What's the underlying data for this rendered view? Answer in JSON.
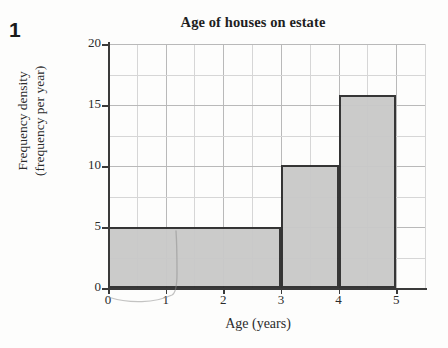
{
  "question_number": "1",
  "chart_data": {
    "type": "bar",
    "title": "Age of houses on estate",
    "xlabel": "Age (years)",
    "ylabel_line1": "Frequency density",
    "ylabel_line2": "(frequency per year)",
    "xlim": [
      0,
      5.5
    ],
    "ylim": [
      0,
      20
    ],
    "grid": true,
    "grid_x_step": 0.5,
    "grid_y_step": 2.5,
    "legend": "none",
    "x_ticks": [
      "0",
      "1",
      "2",
      "3",
      "4",
      "5"
    ],
    "x_tick_values": [
      0,
      1,
      2,
      3,
      4,
      5
    ],
    "y_ticks": [
      "0",
      "5",
      "10",
      "15",
      "20"
    ],
    "y_tick_values": [
      0,
      5,
      10,
      15,
      20
    ],
    "bars": [
      {
        "label": "0-3",
        "x_start": 0,
        "x_end": 3,
        "value": 5.0
      },
      {
        "label": "3-4",
        "x_start": 3,
        "x_end": 4,
        "value": 10.1
      },
      {
        "label": "4-5",
        "x_start": 4,
        "x_end": 5,
        "value": 15.8
      }
    ],
    "bar_fill_color": "#c9c9c9",
    "bar_edge_color": "#2e2e2e",
    "grid_color": "#b9b9b9",
    "axis_color": "#3a3a3a"
  },
  "annotations": {
    "pencil_mark": "faint hand-drawn pencil curve from origin to x=1"
  }
}
